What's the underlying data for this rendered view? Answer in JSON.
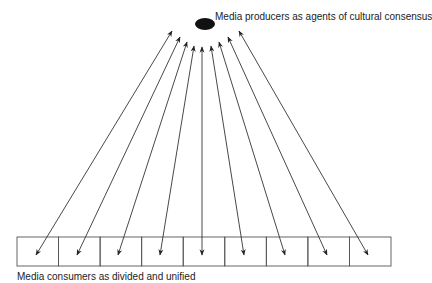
{
  "diagram": {
    "producer": {
      "label": "Media producers as agents of cultural consensus",
      "node": {
        "cx": 205,
        "cy": 24,
        "rx": 10,
        "ry": 6,
        "color": "#111111"
      }
    },
    "consumers": {
      "label": "Media consumers as divided and unified",
      "box_count": 9,
      "box_row": {
        "x": 17,
        "y": 237,
        "width": 374,
        "height": 29
      }
    },
    "arrows": [
      {
        "top": [
          172,
          31
        ],
        "bottom": [
          36,
          255
        ]
      },
      {
        "top": [
          180,
          37
        ],
        "bottom": [
          77,
          255
        ]
      },
      {
        "top": [
          187,
          42
        ],
        "bottom": [
          118,
          255
        ]
      },
      {
        "top": [
          194,
          46
        ],
        "bottom": [
          160,
          255
        ]
      },
      {
        "top": [
          202,
          47
        ],
        "bottom": [
          202,
          255
        ]
      },
      {
        "top": [
          211,
          46
        ],
        "bottom": [
          244,
          255
        ]
      },
      {
        "top": [
          219,
          42
        ],
        "bottom": [
          285,
          255
        ]
      },
      {
        "top": [
          228,
          37
        ],
        "bottom": [
          327,
          255
        ]
      },
      {
        "top": [
          239,
          31
        ],
        "bottom": [
          368,
          255
        ]
      }
    ],
    "arrow_style": "double-headed",
    "stroke_color": "#333333"
  }
}
